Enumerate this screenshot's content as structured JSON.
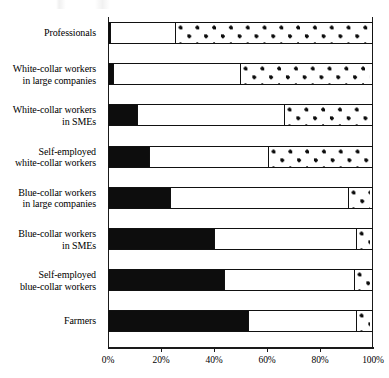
{
  "chart_data": {
    "type": "bar",
    "orientation": "horizontal",
    "stacked": true,
    "title": "",
    "subtitle": "",
    "xlabel": "",
    "ylabel": "",
    "xlim": [
      0,
      100
    ],
    "xticks": [
      0,
      20,
      40,
      60,
      80,
      100
    ],
    "xtick_labels": [
      "0%",
      "20%",
      "40%",
      "60%",
      "80%",
      "100%"
    ],
    "grid": false,
    "legend": null,
    "categories": [
      "Professionals",
      "White-collar workers\nin large companies",
      "White-collar workers\nin SMEs",
      "Self-employed\nwhite-collar workers",
      "Blue-collar workers\nin large companies",
      "Blue-collar workers\nin SMEs",
      "Self-employed\nblue-collar workers",
      "Farmers"
    ],
    "series": [
      {
        "name": "black-segment",
        "fill": "solid-black",
        "color": "#0d0d0d",
        "values": [
          1,
          2,
          11,
          15.5,
          23.5,
          40,
          44,
          53
        ]
      },
      {
        "name": "white-segment",
        "fill": "solid-white",
        "color": "#ffffff",
        "values": [
          25.5,
          49,
          56.5,
          46,
          68,
          54.5,
          50,
          41.5
        ]
      },
      {
        "name": "dotted-segment",
        "fill": "dotted",
        "color": "#ffffff",
        "values": [
          73.5,
          49,
          32.5,
          38.5,
          8.5,
          5.5,
          6,
          5.5
        ]
      }
    ]
  }
}
